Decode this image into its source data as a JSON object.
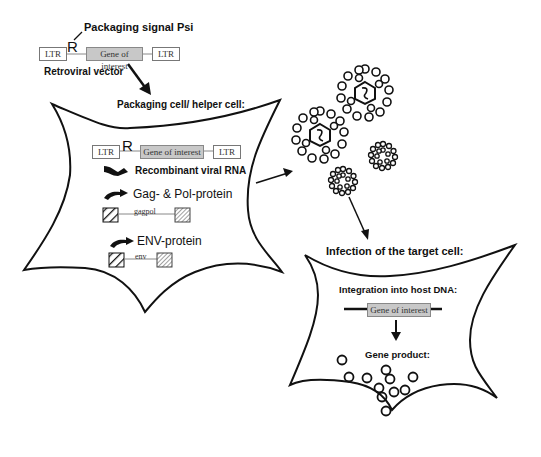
{
  "diagram": {
    "vector": {
      "signal_label": "Packaging signal Psi",
      "psi_symbol": "R",
      "ltr_left": "LTR",
      "gene": "Gene of interest",
      "ltr_right": "LTR",
      "caption": "Retroviral vector"
    },
    "packaging_cell": {
      "title": "Packaging cell/ helper cell:",
      "construct": {
        "psi_symbol": "R",
        "ltr_left": "LTR",
        "gene": "Gene of interest",
        "ltr_right": "LTR"
      },
      "rna_label": "Recombinant viral RNA",
      "gagpol_label": "Gag- & Pol-protein",
      "gagpol_gene": "gagpol",
      "env_label": "ENV-protein",
      "env_gene": "env"
    },
    "target_cell": {
      "title": "Infection of the target cell:",
      "integration_label": "Integration into host DNA:",
      "gene": "Gene of interest",
      "product_label": "Gene product:"
    },
    "colors": {
      "line": "#111111",
      "gene_box": "#c8c8c8",
      "ltr_border": "#777777"
    }
  }
}
